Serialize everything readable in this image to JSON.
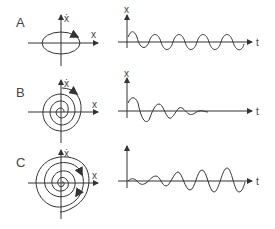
{
  "figure": {
    "rows": [
      {
        "label": "A",
        "phase_portrait": {
          "type": "ellipse",
          "x_axis": "x",
          "y_axis": "ẋ"
        },
        "time_series": {
          "type": "undamped",
          "x_axis": "t",
          "y_axis": "x"
        }
      },
      {
        "label": "B",
        "phase_portrait": {
          "type": "inward-spiral",
          "x_axis": "x",
          "y_axis": "ẋ"
        },
        "time_series": {
          "type": "damped",
          "x_axis": "t",
          "y_axis": "x"
        }
      },
      {
        "label": "C",
        "phase_portrait": {
          "type": "outward-spiral",
          "x_axis": "x",
          "y_axis": "ẋ"
        },
        "time_series": {
          "type": "growing",
          "x_axis": "t",
          "y_axis": "x"
        }
      }
    ],
    "colors": {
      "stroke": "#333333",
      "background": "#ffffff"
    }
  }
}
